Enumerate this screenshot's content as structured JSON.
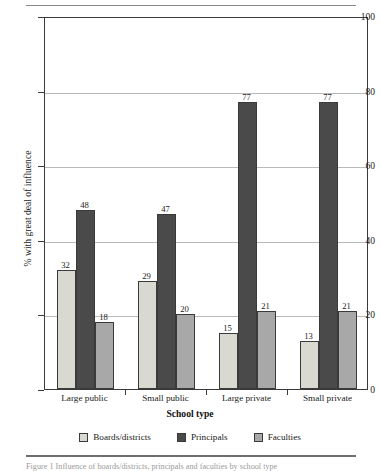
{
  "figure": {
    "caption": "Figure 1  Influence of boards/districts, principals and faculties by school type",
    "top_rule": "horizontal-rule",
    "bottom_rule": "horizontal-rule"
  },
  "chart_data": {
    "type": "bar",
    "title": "",
    "xlabel": "School type",
    "ylabel": "% with great deal of influence",
    "categories": [
      "Large public",
      "Small public",
      "Large private",
      "Small private"
    ],
    "series": [
      {
        "name": "Boards/districts",
        "values": [
          32,
          29,
          15,
          13
        ],
        "color": "#d9d9d1"
      },
      {
        "name": "Principals",
        "values": [
          48,
          47,
          77,
          77
        ],
        "color": "#4a4a4a"
      },
      {
        "name": "Faculties",
        "values": [
          18,
          20,
          21,
          21
        ],
        "color": "#a8a8a8"
      }
    ],
    "ylim": [
      0,
      100
    ],
    "yticks": [
      0,
      20,
      40,
      60,
      80,
      100
    ],
    "ytick_labels": [
      "0",
      "20",
      "40",
      "60",
      "80",
      "100"
    ],
    "grid": true,
    "grid_axis": "y",
    "legend_position": "bottom",
    "show_value_labels": true
  },
  "colors": {
    "axis": "#3a3a3a",
    "grid": "#b9b9b9",
    "text": "#1a1a1a",
    "background": "#ffffff",
    "rule": "#8a8a8a"
  }
}
